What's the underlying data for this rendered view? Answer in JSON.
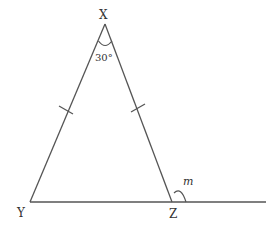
{
  "diagram": {
    "type": "geometry-triangle",
    "vertices": {
      "X": {
        "label": "X"
      },
      "Y": {
        "label": "Y"
      },
      "Z": {
        "label": "Z"
      }
    },
    "angles": {
      "apex_angle": "30°",
      "exterior_angle": "m"
    },
    "equal_sides": [
      "XY",
      "XZ"
    ],
    "colors": {
      "line": "#555555",
      "text": "#333333",
      "background": "#ffffff"
    }
  }
}
